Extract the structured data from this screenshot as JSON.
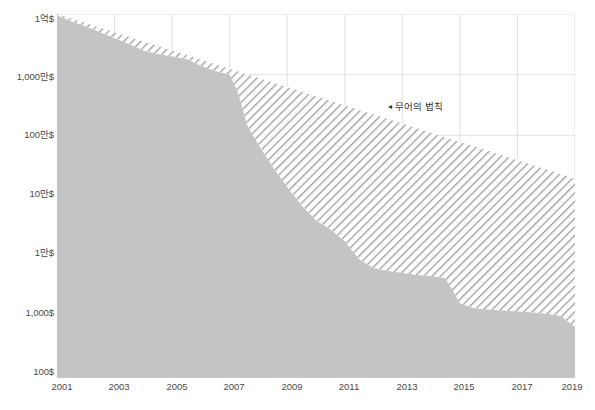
{
  "chart_data": {
    "type": "area",
    "title": "",
    "subtitle": "",
    "xlabel": "",
    "ylabel": "",
    "scale": "log",
    "grid": true,
    "legend_position": "inline-annotation",
    "xlim": [
      2001,
      2019
    ],
    "ylim": [
      100,
      100000000
    ],
    "x_ticks": [
      "2001",
      "2003",
      "2005",
      "2007",
      "2009",
      "2011",
      "2013",
      "2015",
      "2017",
      "2019"
    ],
    "y_ticks": [
      "1억$",
      "1,000만$",
      "100만$",
      "10만$",
      "1만$",
      "1,000$",
      "100$"
    ],
    "y_tick_values": [
      100000000,
      10000000,
      1000000,
      100000,
      10000,
      1000,
      100
    ],
    "annotations": [
      {
        "text": "무어의 법칙",
        "marker": "◄",
        "x": 2013.6,
        "y": 2600000
      }
    ],
    "series": [
      {
        "name": "시퀀싱 비용",
        "type": "area",
        "fill": "#c4c4c4",
        "x": [
          2001,
          2001.5,
          2002,
          2002.5,
          2003,
          2003.5,
          2004,
          2004.5,
          2005,
          2005.5,
          2006,
          2006.5,
          2007,
          2007.3,
          2007.6,
          2008,
          2008.5,
          2009,
          2009.5,
          2010,
          2010.5,
          2011,
          2011.5,
          2012,
          2012.5,
          2013,
          2013.5,
          2014,
          2014.5,
          2015,
          2015.5,
          2016,
          2016.5,
          2017,
          2017.5,
          2018,
          2018.5,
          2019
        ],
        "values": [
          95000000,
          75000000,
          62000000,
          50000000,
          40000000,
          32000000,
          25000000,
          22000000,
          20000000,
          18000000,
          14000000,
          11500000,
          10000000,
          5000000,
          1500000,
          700000,
          300000,
          140000,
          70000,
          40000,
          28000,
          18000,
          9000,
          6500,
          5800,
          5400,
          5000,
          4800,
          4400,
          1700,
          1400,
          1350,
          1300,
          1250,
          1200,
          1150,
          1050,
          700
        ]
      },
      {
        "name": "무어의 법칙",
        "type": "line-hatched-band",
        "hatch": "diagonal",
        "x": [
          2001,
          2003,
          2005,
          2007,
          2009,
          2011,
          2013,
          2015,
          2017,
          2019
        ],
        "values": [
          100000000,
          50000000,
          25000000,
          12500000,
          6250000,
          3100000,
          1560000,
          780000,
          390000,
          195000
        ]
      }
    ]
  },
  "colors": {
    "area_fill": "#c4c4c4",
    "hatch_stroke": "#9a9a9a",
    "gridline": "#e2e2e2",
    "text": "#4a4a4a",
    "background": "#ffffff"
  }
}
